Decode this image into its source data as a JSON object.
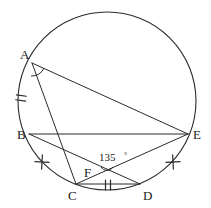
{
  "figure": {
    "type": "geometry-diagram",
    "canvas": {
      "width": 211,
      "height": 208
    },
    "stroke_color": "#2b2b2b",
    "background_color": "#ffffff"
  },
  "circle": {
    "name": "circumscribed-circle",
    "cx": 107,
    "cy": 101,
    "r": 89
  },
  "points": [
    {
      "id": "A",
      "label": "A",
      "x": 32,
      "y": 63,
      "label_x": 20,
      "label_y": 59
    },
    {
      "id": "B",
      "label": "B",
      "x": 29,
      "y": 134,
      "label_x": 17,
      "label_y": 139
    },
    {
      "id": "C",
      "label": "C",
      "x": 76,
      "y": 184,
      "label_x": 68,
      "label_y": 200
    },
    {
      "id": "D",
      "label": "D",
      "x": 140,
      "y": 184,
      "label_x": 143,
      "label_y": 200
    },
    {
      "id": "E",
      "label": "E",
      "x": 188,
      "y": 134,
      "label_x": 193,
      "label_y": 139
    },
    {
      "id": "F",
      "label": "F",
      "x": 107,
      "y": 171,
      "label_x": 84,
      "label_y": 177
    }
  ],
  "segments": [
    {
      "id": "AE",
      "from": "A",
      "to": "E",
      "name": "chord-a-e"
    },
    {
      "id": "AC",
      "from": "A",
      "to": "C",
      "name": "chord-a-c"
    },
    {
      "id": "BE",
      "from": "B",
      "to": "E",
      "name": "chord-b-e"
    },
    {
      "id": "BD",
      "from": "B",
      "to": "D",
      "name": "chord-b-d"
    },
    {
      "id": "CE",
      "from": "C",
      "to": "E",
      "name": "chord-c-e"
    },
    {
      "id": "CD",
      "from": "C",
      "to": "D",
      "name": "chord-c-d"
    }
  ],
  "tick_marks": [
    {
      "id": "arc-AB-tick",
      "style": "double",
      "on": "arc AB",
      "x": 21,
      "y": 98,
      "rotation": 10
    },
    {
      "id": "arc-BC-tick",
      "style": "single-cross",
      "on": "arc BC",
      "x": 42,
      "y": 162,
      "rotation": 48
    },
    {
      "id": "arc-DE-tick",
      "style": "single-cross",
      "on": "arc DE",
      "x": 173,
      "y": 162,
      "rotation": -48
    },
    {
      "id": "seg-CD-tick",
      "style": "double",
      "on": "segment CD",
      "x": 108,
      "y": 185,
      "rotation": 0
    }
  ],
  "angles": [
    {
      "id": "angle-A",
      "vertex": "A",
      "label": "",
      "marker": "arc",
      "note": "unlabeled angle arc at vertex A between chords AB and AE"
    },
    {
      "id": "angle-F",
      "vertex": "F",
      "label": "135",
      "degree_symbol": "°",
      "full_label": "135 °",
      "label_x": 101,
      "label_y": 161,
      "marker": "arc",
      "note": "angle between BD and CE at intersection point F"
    }
  ]
}
